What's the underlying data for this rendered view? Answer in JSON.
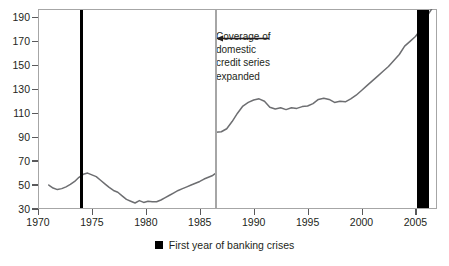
{
  "chart_data": {
    "type": "line",
    "title": "",
    "subtitle": "",
    "xlabel": "",
    "ylabel": "",
    "xlim": [
      1970,
      2007
    ],
    "ylim": [
      30,
      197
    ],
    "grid": false,
    "legend_position": "bottom-center",
    "y_ticks": [
      30,
      50,
      70,
      90,
      110,
      130,
      150,
      170,
      190
    ],
    "y_tick_labels": [
      "30",
      "50",
      "70",
      "90",
      "110",
      "130",
      "150",
      "170",
      "190"
    ],
    "x_ticks": [
      1970,
      1975,
      1980,
      1985,
      1990,
      1995,
      2000,
      2005
    ],
    "x_tick_labels": [
      "1970",
      "1975",
      "1980",
      "1985",
      "1990",
      "1995",
      "2000",
      "2005"
    ],
    "line_color": "#6d6e71",
    "series": [
      {
        "name": "Domestic credit (narrow coverage)",
        "x": [
          1971.0,
          1971.4,
          1971.8,
          1972.2,
          1972.6,
          1973.0,
          1973.4,
          1973.8,
          1974.2,
          1974.6,
          1975.0,
          1975.4,
          1975.8,
          1976.2,
          1976.6,
          1977.0,
          1977.4,
          1977.8,
          1978.2,
          1978.6,
          1979.0,
          1979.4,
          1979.8,
          1980.2,
          1980.6,
          1981.0,
          1981.4,
          1981.8,
          1982.2,
          1982.6,
          1983.0,
          1983.4,
          1983.8,
          1984.2,
          1984.6,
          1985.0,
          1985.4,
          1985.8,
          1986.2,
          1986.5
        ],
        "values": [
          50.0,
          47.5,
          46.2,
          47.0,
          48.5,
          50.5,
          53.0,
          56.5,
          59.0,
          60.0,
          58.5,
          57.0,
          54.0,
          51.0,
          48.0,
          45.5,
          44.0,
          41.0,
          38.0,
          36.5,
          35.0,
          37.0,
          35.5,
          36.5,
          36.0,
          36.0,
          37.5,
          39.5,
          41.5,
          43.5,
          45.5,
          47.0,
          48.5,
          50.0,
          51.5,
          53.0,
          55.0,
          56.5,
          58.0,
          60.0
        ]
      },
      {
        "name": "Domestic credit (expanded coverage)",
        "x": [
          1986.5,
          1987.0,
          1987.5,
          1988.0,
          1988.5,
          1989.0,
          1989.5,
          1990.0,
          1990.5,
          1991.0,
          1991.5,
          1992.0,
          1992.5,
          1993.0,
          1993.5,
          1994.0,
          1994.5,
          1995.0,
          1995.5,
          1996.0,
          1996.5,
          1997.0,
          1997.5,
          1998.0,
          1998.5,
          1999.0,
          1999.5,
          2000.0,
          2000.5,
          2001.0,
          2001.5,
          2002.0,
          2002.5,
          2003.0,
          2003.5,
          2004.0,
          2004.5,
          2005.0,
          2005.5,
          2006.0,
          2006.5
        ],
        "values": [
          94.0,
          94.5,
          97.0,
          103.0,
          110.0,
          116.0,
          119.0,
          121.0,
          122.0,
          120.0,
          115.0,
          113.5,
          114.5,
          113.0,
          114.5,
          114.0,
          115.5,
          116.0,
          118.0,
          121.5,
          122.5,
          121.5,
          119.0,
          120.0,
          119.5,
          122.0,
          125.0,
          129.0,
          133.0,
          137.0,
          141.0,
          145.0,
          149.0,
          154.0,
          159.0,
          166.0,
          170.0,
          174.0,
          180.0,
          190.0,
          197.0
        ]
      }
    ],
    "annotations": [
      {
        "name": "coverage-note",
        "text": "Coverage of\ndomestic\ncredit series\nexpanded",
        "arrow_direction": "left",
        "x": 1986.5
      }
    ],
    "vertical_markers": [
      {
        "name": "banking-crisis-1974",
        "year": 1974,
        "color": "#000000",
        "width_years": 0.28
      },
      {
        "name": "banking-crisis-2005",
        "year": 2005.7,
        "color": "#000000",
        "width_years": 1.1
      }
    ],
    "break_line": {
      "name": "series-break-1986",
      "x": 1986.5,
      "color": "#a6a6a6"
    }
  },
  "legend": {
    "swatch_color": "#000000",
    "label": "First year of banking crises"
  }
}
